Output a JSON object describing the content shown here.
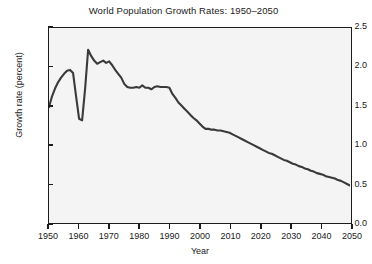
{
  "chart_data": {
    "type": "line",
    "title": "World Population Growth Rates: 1950–2050",
    "xlabel": "Year",
    "ylabel": "Growth rate (percent)",
    "xlim": [
      1950,
      2050
    ],
    "ylim": [
      0.0,
      2.5
    ],
    "grid": false,
    "legend": null,
    "line_color": "#3a3a3a",
    "plot_background": "#f4f4f4",
    "xticks": [
      1950,
      1960,
      1970,
      1980,
      1990,
      2000,
      2010,
      2020,
      2030,
      2040,
      2050
    ],
    "xtick_labels": [
      "1950",
      "1960",
      "1970",
      "1980",
      "1990",
      "2000",
      "2010",
      "2020",
      "2030",
      "2040",
      "2050"
    ],
    "yticks": [
      0.0,
      0.5,
      1.0,
      1.5,
      2.0,
      2.5
    ],
    "ytick_labels": [
      "0.0",
      "0.5",
      "1.0",
      "1.5",
      "2.0",
      "2.5"
    ],
    "series": [
      {
        "name": "World population growth rate",
        "x": [
          1950,
          1951,
          1952,
          1953,
          1954,
          1955,
          1956,
          1957,
          1958,
          1959,
          1960,
          1961,
          1962,
          1963,
          1964,
          1965,
          1966,
          1967,
          1968,
          1969,
          1970,
          1971,
          1972,
          1973,
          1974,
          1975,
          1976,
          1977,
          1978,
          1979,
          1980,
          1981,
          1982,
          1983,
          1984,
          1985,
          1986,
          1987,
          1988,
          1989,
          1990,
          1991,
          1992,
          1993,
          1994,
          1995,
          1996,
          1997,
          1998,
          1999,
          2000,
          2001,
          2002,
          2003,
          2004,
          2005,
          2006,
          2007,
          2008,
          2009,
          2010,
          2011,
          2012,
          2013,
          2014,
          2015,
          2016,
          2017,
          2018,
          2019,
          2020,
          2021,
          2022,
          2023,
          2024,
          2025,
          2026,
          2027,
          2028,
          2029,
          2030,
          2031,
          2032,
          2033,
          2034,
          2035,
          2036,
          2037,
          2038,
          2039,
          2040,
          2041,
          2042,
          2043,
          2044,
          2045,
          2046,
          2047,
          2048,
          2049,
          2050
        ],
        "y": [
          1.48,
          1.62,
          1.72,
          1.8,
          1.86,
          1.91,
          1.95,
          1.96,
          1.92,
          1.62,
          1.33,
          1.31,
          1.72,
          2.22,
          2.14,
          2.08,
          2.04,
          2.06,
          2.08,
          2.05,
          2.07,
          2.02,
          1.96,
          1.91,
          1.86,
          1.78,
          1.74,
          1.73,
          1.73,
          1.74,
          1.73,
          1.76,
          1.73,
          1.73,
          1.71,
          1.74,
          1.75,
          1.74,
          1.74,
          1.74,
          1.73,
          1.65,
          1.6,
          1.54,
          1.5,
          1.46,
          1.42,
          1.38,
          1.34,
          1.31,
          1.27,
          1.23,
          1.2,
          1.2,
          1.19,
          1.19,
          1.18,
          1.18,
          1.17,
          1.16,
          1.15,
          1.13,
          1.11,
          1.09,
          1.07,
          1.05,
          1.03,
          1.01,
          0.99,
          0.97,
          0.95,
          0.93,
          0.91,
          0.89,
          0.88,
          0.86,
          0.84,
          0.82,
          0.8,
          0.79,
          0.77,
          0.75,
          0.74,
          0.72,
          0.71,
          0.69,
          0.68,
          0.66,
          0.65,
          0.63,
          0.62,
          0.61,
          0.59,
          0.58,
          0.57,
          0.56,
          0.54,
          0.53,
          0.51,
          0.49,
          0.47
        ]
      }
    ],
    "annotations": []
  }
}
